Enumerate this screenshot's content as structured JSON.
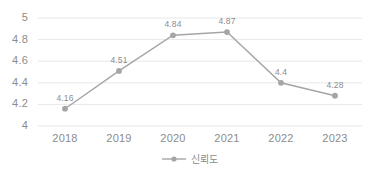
{
  "chart_data": {
    "type": "line",
    "title": "",
    "xlabel": "",
    "ylabel": "",
    "categories": [
      "2018",
      "2019",
      "2020",
      "2021",
      "2022",
      "2023"
    ],
    "series": [
      {
        "name": "신뢰도",
        "values": [
          4.16,
          4.51,
          4.84,
          4.87,
          4.4,
          4.28
        ],
        "labels": [
          "4.16",
          "4.51",
          "4.84",
          "4.87",
          "4.4",
          "4.28"
        ],
        "color": "#a5a5a5"
      }
    ],
    "ylim": [
      4,
      5
    ],
    "yticks": [
      4,
      4.2,
      4.4,
      4.6,
      4.8,
      5
    ],
    "ytick_labels": [
      "4",
      "4.2",
      "4.4",
      "4.6",
      "4.8",
      "5"
    ],
    "grid": true,
    "grid_axis": "y",
    "legend": {
      "position": "bottom",
      "entries": [
        "신뢰도"
      ]
    },
    "data_labels_shown": true
  },
  "style": {
    "line_color": "#a5a5a5",
    "marker_color": "#a5a5a5",
    "grid_color": "#e8e8e8",
    "text_color": "#8c8c8c",
    "background": "#ffffff"
  }
}
